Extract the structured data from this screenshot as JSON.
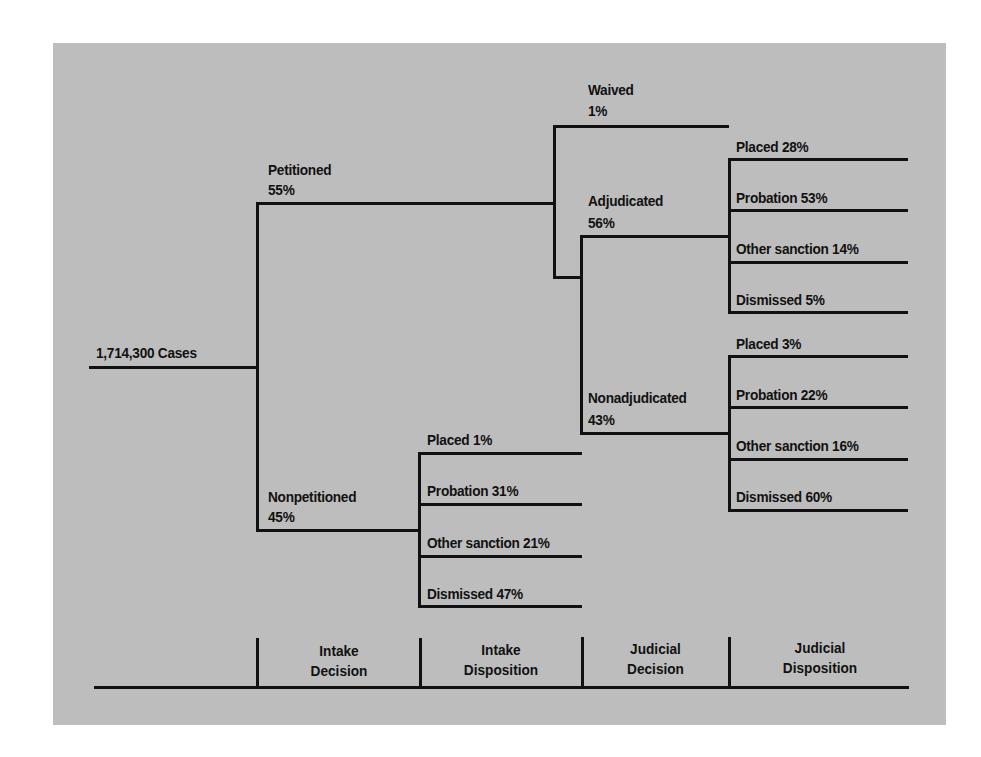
{
  "diagram": {
    "root": {
      "label": "1,714,300 Cases"
    },
    "intake_decision": [
      {
        "name": "Petitioned",
        "pct": "55%"
      },
      {
        "name": "Nonpetitioned",
        "pct": "45%"
      }
    ],
    "petitioned_branches": [
      {
        "name": "Waived",
        "pct": "1%"
      },
      {
        "name": "Adjudicated",
        "pct": "56%"
      },
      {
        "name": "Nonadjudicated",
        "pct": "43%"
      }
    ],
    "adjudicated_dispositions": [
      {
        "label": "Placed 28%"
      },
      {
        "label": "Probation 53%"
      },
      {
        "label": "Other sanction 14%"
      },
      {
        "label": "Dismissed 5%"
      }
    ],
    "nonadjudicated_dispositions": [
      {
        "label": "Placed 3%"
      },
      {
        "label": "Probation 22%"
      },
      {
        "label": "Other sanction 16%"
      },
      {
        "label": "Dismissed 60%"
      }
    ],
    "nonpetitioned_dispositions": [
      {
        "label": "Placed 1%"
      },
      {
        "label": "Probation 31%"
      },
      {
        "label": "Other sanction 21%"
      },
      {
        "label": "Dismissed 47%"
      }
    ],
    "stage_labels": [
      {
        "line1": "Intake",
        "line2": "Decision"
      },
      {
        "line1": "Intake",
        "line2": "Disposition"
      },
      {
        "line1": "Judicial",
        "line2": "Decision"
      },
      {
        "line1": "Judicial",
        "line2": "Disposition"
      }
    ],
    "colors": {
      "background": "#bdbdbd",
      "lines": "#111111",
      "page": "#ffffff"
    }
  }
}
